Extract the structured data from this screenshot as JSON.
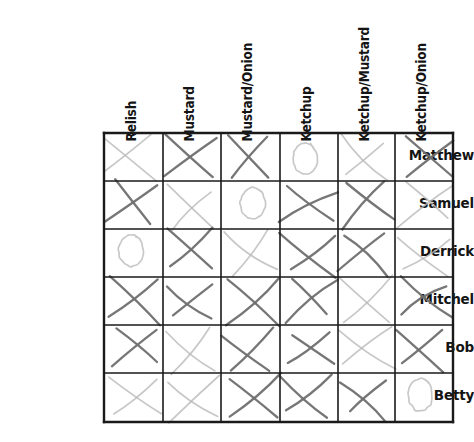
{
  "figure": {
    "kind": "hand-drawn-preference-matrix",
    "background_color": "#ffffff",
    "grid_line_color": "#1a1a1a",
    "mark_color_dark": "#6f6f6f",
    "mark_color_light": "#b9b9b9",
    "text_color": "#141414"
  },
  "grid": {
    "left": 104,
    "top": 133,
    "right": 453,
    "bottom": 422,
    "column_edges": [
      104,
      163,
      221,
      280,
      338,
      395,
      453
    ],
    "row_edges": [
      133,
      181,
      229,
      277,
      325,
      373,
      422
    ],
    "columns": 6,
    "rows": 6
  },
  "column_headers": [
    {
      "label": "Relish",
      "x": 138,
      "y": 128
    },
    {
      "label": "Mustard",
      "x": 196,
      "y": 128
    },
    {
      "label": "Mustard/Onion",
      "x": 254,
      "y": 128
    },
    {
      "label": "Ketchup",
      "x": 313,
      "y": 128
    },
    {
      "label": "Ketchup/Mustard",
      "x": 371,
      "y": 128
    },
    {
      "label": "Ketchup/Onion",
      "x": 428,
      "y": 128
    }
  ],
  "row_labels": [
    {
      "label": "Matthew",
      "y": 149
    },
    {
      "label": "Samuel",
      "y": 197
    },
    {
      "label": "Derrick",
      "y": 245
    },
    {
      "label": "Mitchel",
      "y": 293
    },
    {
      "label": "Bob",
      "y": 341
    },
    {
      "label": "Betty",
      "y": 389
    }
  ],
  "marks": [
    {
      "row": "Matthew",
      "col": "Relish",
      "mark": "X",
      "weight": "light"
    },
    {
      "row": "Matthew",
      "col": "Mustard",
      "mark": "X",
      "weight": "dark"
    },
    {
      "row": "Matthew",
      "col": "Mustard/Onion",
      "mark": "X",
      "weight": "dark"
    },
    {
      "row": "Matthew",
      "col": "Ketchup",
      "mark": "O",
      "weight": "light"
    },
    {
      "row": "Matthew",
      "col": "Ketchup/Mustard",
      "mark": "X",
      "weight": "light"
    },
    {
      "row": "Matthew",
      "col": "Ketchup/Onion",
      "mark": "X",
      "weight": "dark"
    },
    {
      "row": "Samuel",
      "col": "Relish",
      "mark": "X",
      "weight": "dark"
    },
    {
      "row": "Samuel",
      "col": "Mustard",
      "mark": "X",
      "weight": "light"
    },
    {
      "row": "Samuel",
      "col": "Mustard/Onion",
      "mark": "O",
      "weight": "light"
    },
    {
      "row": "Samuel",
      "col": "Ketchup",
      "mark": "X",
      "weight": "dark"
    },
    {
      "row": "Samuel",
      "col": "Ketchup/Mustard",
      "mark": "X",
      "weight": "dark"
    },
    {
      "row": "Samuel",
      "col": "Ketchup/Onion",
      "mark": "X",
      "weight": "light"
    },
    {
      "row": "Derrick",
      "col": "Relish",
      "mark": "O",
      "weight": "light"
    },
    {
      "row": "Derrick",
      "col": "Mustard",
      "mark": "X",
      "weight": "dark"
    },
    {
      "row": "Derrick",
      "col": "Mustard/Onion",
      "mark": "X",
      "weight": "light"
    },
    {
      "row": "Derrick",
      "col": "Ketchup",
      "mark": "X",
      "weight": "dark"
    },
    {
      "row": "Derrick",
      "col": "Ketchup/Mustard",
      "mark": "X",
      "weight": "dark"
    },
    {
      "row": "Derrick",
      "col": "Ketchup/Onion",
      "mark": "X",
      "weight": "light"
    },
    {
      "row": "Mitchel",
      "col": "Relish",
      "mark": "X",
      "weight": "dark"
    },
    {
      "row": "Mitchel",
      "col": "Mustard",
      "mark": "X",
      "weight": "dark"
    },
    {
      "row": "Mitchel",
      "col": "Mustard/Onion",
      "mark": "X",
      "weight": "dark"
    },
    {
      "row": "Mitchel",
      "col": "Ketchup",
      "mark": "X",
      "weight": "dark"
    },
    {
      "row": "Mitchel",
      "col": "Ketchup/Mustard",
      "mark": "X",
      "weight": "light"
    },
    {
      "row": "Mitchel",
      "col": "Ketchup/Onion",
      "mark": "X",
      "weight": "dark"
    },
    {
      "row": "Bob",
      "col": "Relish",
      "mark": "X",
      "weight": "dark"
    },
    {
      "row": "Bob",
      "col": "Mustard",
      "mark": "X",
      "weight": "light"
    },
    {
      "row": "Bob",
      "col": "Mustard/Onion",
      "mark": "X",
      "weight": "dark"
    },
    {
      "row": "Bob",
      "col": "Ketchup",
      "mark": "X",
      "weight": "dark"
    },
    {
      "row": "Bob",
      "col": "Ketchup/Mustard",
      "mark": "X",
      "weight": "light"
    },
    {
      "row": "Bob",
      "col": "Ketchup/Onion",
      "mark": "X",
      "weight": "dark"
    },
    {
      "row": "Betty",
      "col": "Relish",
      "mark": "X",
      "weight": "light"
    },
    {
      "row": "Betty",
      "col": "Mustard",
      "mark": "X",
      "weight": "light"
    },
    {
      "row": "Betty",
      "col": "Mustard/Onion",
      "mark": "X",
      "weight": "dark"
    },
    {
      "row": "Betty",
      "col": "Ketchup",
      "mark": "X",
      "weight": "dark"
    },
    {
      "row": "Betty",
      "col": "Ketchup/Mustard",
      "mark": "X",
      "weight": "dark"
    },
    {
      "row": "Betty",
      "col": "Ketchup/Onion",
      "mark": "O",
      "weight": "light"
    }
  ]
}
